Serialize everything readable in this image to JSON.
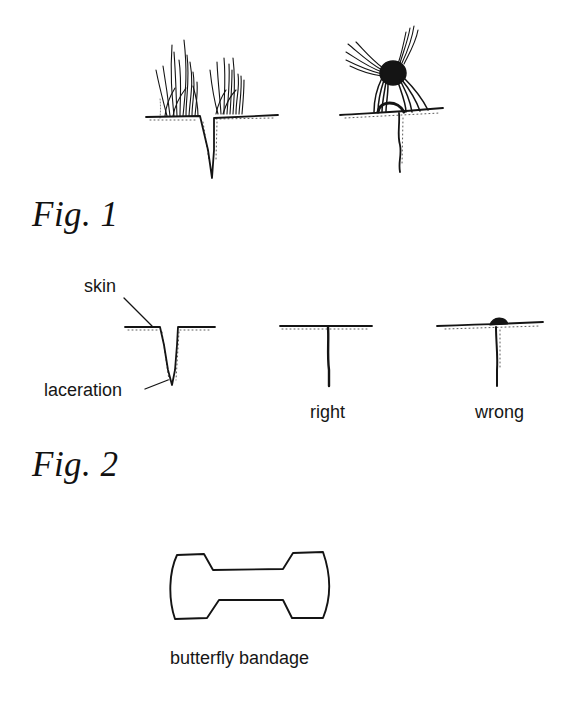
{
  "figures": [
    {
      "caption": "Fig. 1",
      "panels": [
        {
          "name": "laceration-with-hair",
          "description": "open wound with hair standing on both sides"
        },
        {
          "name": "hair-tied-over-wound",
          "description": "hair twisted and knotted across the closed wound"
        }
      ]
    },
    {
      "caption": "Fig. 2",
      "labels": {
        "skin": "skin",
        "laceration": "laceration",
        "right": "right",
        "wrong": "wrong"
      }
    },
    {
      "caption": "",
      "labels": {
        "butterfly_bandage": "butterfly bandage"
      }
    }
  ],
  "colors": {
    "ink": "#141414",
    "paper": "#ffffff"
  }
}
